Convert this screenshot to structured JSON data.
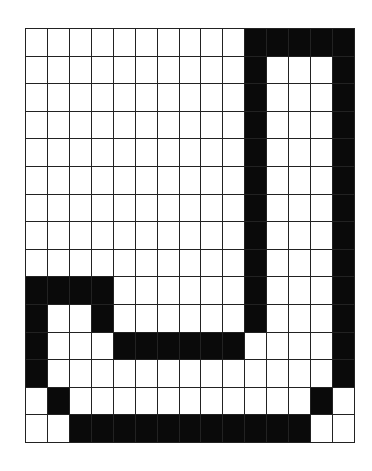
{
  "grid": {
    "rows": 15,
    "cols": 15,
    "fill_color": "#0a0a0a",
    "empty_color": "#ffffff",
    "line_color": "#222222",
    "cells": [
      "000000000011111",
      "000000000010001",
      "000000000010001",
      "000000000010001",
      "000000000010001",
      "000000000010001",
      "000000000010001",
      "000000000010001",
      "000000000010001",
      "111100000010001",
      "100100000010001",
      "100011111100001",
      "100000000000001",
      "010000000000010",
      "001111111111100"
    ]
  }
}
